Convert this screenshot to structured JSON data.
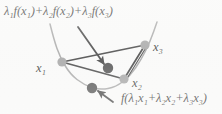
{
  "figure": {
    "background_color": "#fbfbfa",
    "curve_color": "#9d9d9d",
    "chord_color": "#2c2c2c",
    "sample_point_color": "#9a9a9a",
    "value_point_color": "#3a3a3a",
    "text_color": "#1b1b1b"
  },
  "labels": {
    "upper_expression": {
      "text": "λ₁f(x₁)+λ₂f(x₂)+λ₃f(x₃)",
      "parts": [
        {
          "sym": "λ",
          "sub": "1"
        },
        {
          "sym": "f(x",
          "sub": "1"
        },
        {
          "sym": ")+λ",
          "sub": "2"
        },
        {
          "sym": "f(x",
          "sub": "2"
        },
        {
          "sym": ")+λ",
          "sub": "3"
        },
        {
          "sym": "f(x",
          "sub": "3"
        },
        {
          "sym": ")",
          "sub": ""
        }
      ]
    },
    "lower_expression": {
      "text": "f(λ₁x₁+λ₂x₂+λ₃x₃)"
    },
    "point_x1": "x₁",
    "point_x2": "x₂",
    "point_x3": "x₃"
  },
  "chart_data": {
    "type": "scatter",
    "xlabel": "",
    "ylabel": "",
    "grid": false,
    "legend": null,
    "xlim": [
      0,
      222
    ],
    "ylim": [
      114,
      0
    ],
    "curve": {
      "name": "convex function f",
      "color": "#9d9d9d",
      "description": "upward opening parabola-like convex curve",
      "path_points": [
        [
          50,
          24
        ],
        [
          54,
          40
        ],
        [
          60,
          57
        ],
        [
          70,
          74
        ],
        [
          84,
          85
        ],
        [
          100,
          90
        ],
        [
          116,
          87
        ],
        [
          130,
          76
        ],
        [
          141,
          60
        ],
        [
          150,
          42
        ],
        [
          157,
          22
        ]
      ]
    },
    "sample_points": [
      {
        "label": "x₁",
        "x": 62,
        "y": 62,
        "color": "#9a9a9a",
        "radius": 4.6
      },
      {
        "label": "x₂",
        "x": 124,
        "y": 79,
        "color": "#9a9a9a",
        "radius": 4.6
      },
      {
        "label": "x₃",
        "x": 145,
        "y": 45,
        "color": "#9a9a9a",
        "radius": 4.6
      }
    ],
    "value_points": [
      {
        "label": "λ₁f(x₁)+λ₂f(x₂)+λ₃f(x₃)",
        "x": 108,
        "y": 68,
        "color": "#3a3a3a",
        "radius": 5.2
      },
      {
        "label": "f(λ₁x₁+λ₂x₂+λ₃x₃)",
        "x": 92,
        "y": 88,
        "color": "#3a3a3a",
        "radius": 5.2
      }
    ],
    "chords": [
      {
        "from": "x₁",
        "to": "x₃",
        "x1": 62,
        "y1": 62,
        "x2": 145,
        "y2": 45
      },
      {
        "from": "x₁",
        "to": "x₂",
        "x1": 62,
        "y1": 62,
        "x2": 124,
        "y2": 79
      },
      {
        "from": "x₂",
        "to": "x₃",
        "x1": 124,
        "y1": 79,
        "x2": 145,
        "y2": 45
      }
    ],
    "annotations": [
      {
        "name": "upper-arrow",
        "from": [
          78,
          27
        ],
        "to": [
          104,
          64
        ],
        "target": "λ₁f(x₁)+λ₂f(x₂)+λ₃f(x₃)"
      },
      {
        "name": "lower-arrow",
        "from": [
          113,
          102
        ],
        "to": [
          98,
          91
        ],
        "target": "f(λ₁x₁+λ₂x₂+λ₃x₃)"
      }
    ]
  }
}
